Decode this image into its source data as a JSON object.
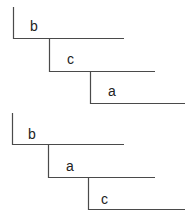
{
  "diagrams": [
    {
      "name": "ordering-1",
      "steps": [
        {
          "label": "b"
        },
        {
          "label": "c"
        },
        {
          "label": "a"
        }
      ]
    },
    {
      "name": "ordering-2",
      "steps": [
        {
          "label": "b"
        },
        {
          "label": "a"
        },
        {
          "label": "c"
        }
      ]
    }
  ]
}
